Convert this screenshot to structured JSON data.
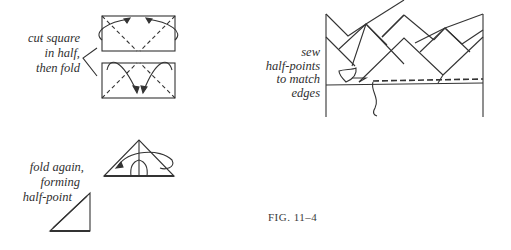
{
  "figure": {
    "caption": "FIG. 11–4"
  },
  "steps": [
    {
      "id": "cut-and-fold",
      "lines": [
        "cut square",
        "in half,",
        "then fold"
      ]
    },
    {
      "id": "fold-again",
      "lines": [
        "fold again,",
        "forming",
        "half-point"
      ]
    },
    {
      "id": "sew",
      "lines": [
        "sew",
        "half-points",
        "to match",
        "edges"
      ]
    }
  ],
  "colors": {
    "line": "#333333",
    "background": "#ffffff"
  }
}
